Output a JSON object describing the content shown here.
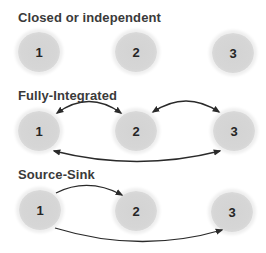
{
  "header": {
    "cutoff_text": "..."
  },
  "sections": [
    {
      "title": "Closed or independent",
      "nodes": [
        {
          "label": "1",
          "x": 39,
          "y": 52
        },
        {
          "label": "2",
          "x": 136,
          "y": 52
        },
        {
          "label": "3",
          "x": 233,
          "y": 53
        }
      ],
      "arrows": []
    },
    {
      "title": "Fully-Integrated",
      "nodes": [
        {
          "label": "1",
          "x": 39,
          "y": 131
        },
        {
          "label": "2",
          "x": 136,
          "y": 131
        },
        {
          "label": "3",
          "x": 234,
          "y": 131
        }
      ],
      "arrows": [
        {
          "from": "1",
          "to": "2",
          "direction": "bidirectional",
          "curve": "over"
        },
        {
          "from": "2",
          "to": "3",
          "direction": "bidirectional",
          "curve": "over"
        },
        {
          "from": "1",
          "to": "3",
          "direction": "bidirectional",
          "curve": "under"
        }
      ]
    },
    {
      "title": "Source-Sink",
      "nodes": [
        {
          "label": "1",
          "x": 40,
          "y": 210
        },
        {
          "label": "2",
          "x": 136,
          "y": 211
        },
        {
          "label": "3",
          "x": 232,
          "y": 212
        }
      ],
      "arrows": [
        {
          "from": "1",
          "to": "2",
          "direction": "one-way",
          "curve": "over"
        },
        {
          "from": "1",
          "to": "3",
          "direction": "one-way",
          "curve": "under"
        }
      ]
    }
  ],
  "colors": {
    "node_fill": "#d4d4d4",
    "node_text": "#262626",
    "title_text": "#3a3a3a",
    "arrow": "#2a2a2a"
  }
}
